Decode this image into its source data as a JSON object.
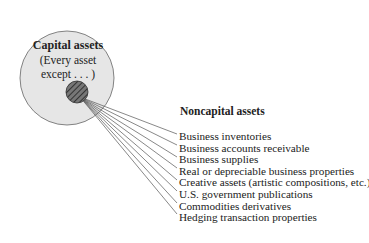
{
  "capital": {
    "title": "Capital assets",
    "subtitle_line1": "(Every asset",
    "subtitle_line2": "except . . . )"
  },
  "noncapital": {
    "title": "Noncapital assets",
    "items": [
      "Business inventories",
      "Business accounts receivable",
      "Business supplies",
      "Real or depreciable business properties",
      "Creative assets (artistic compositions, etc.)",
      "U.S. government publications",
      "Commodities derivatives",
      "Hedging transaction properties"
    ]
  },
  "colors": {
    "big_circle_fill": "#e6e6e6",
    "small_circle_fill": "#555555",
    "line": "#555555"
  }
}
